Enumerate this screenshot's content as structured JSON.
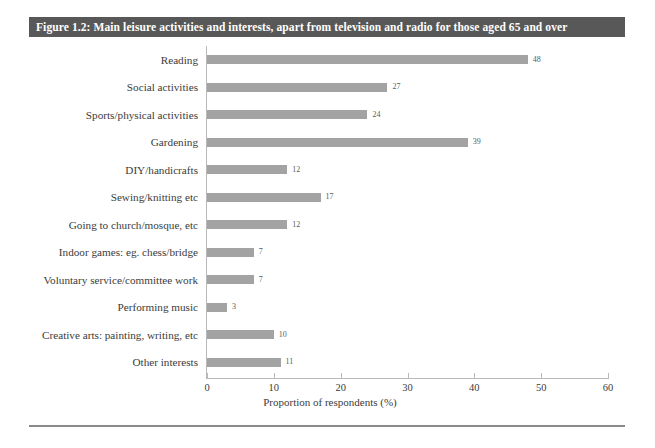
{
  "figure": {
    "title": "Figure 1.2: Main leisure activities and interests, apart from television and radio for those aged 65 and over",
    "title_bar_color": "#585858",
    "title_text_color": "#ffffff",
    "bar_color": "#a3a3a3",
    "axis_color": "#b9b9b9",
    "text_color": "#3b3b3b"
  },
  "chart_data": {
    "type": "bar",
    "orientation": "horizontal",
    "title": "Figure 1.2: Main leisure activities and interests, apart from television and radio for those aged 65 and over",
    "xlabel": "Proportion of respondents (%)",
    "ylabel": "",
    "xlim": [
      0,
      60
    ],
    "xticks": [
      0,
      10,
      20,
      30,
      40,
      50,
      60
    ],
    "xtick_labels": [
      "0",
      "10",
      "20",
      "30",
      "40",
      "50",
      "60"
    ],
    "grid": false,
    "legend": null,
    "categories": [
      "Reading",
      "Social activities",
      "Sports/physical activities",
      "Gardening",
      "DIY/handicrafts",
      "Sewing/knitting etc",
      "Going to church/mosque, etc",
      "Indoor games: eg. chess/bridge",
      "Voluntary service/committee work",
      "Performing music",
      "Creative arts: painting, writing, etc",
      "Other interests"
    ],
    "values": [
      48,
      27,
      24,
      39,
      12,
      17,
      12,
      7,
      7,
      3,
      10,
      11
    ],
    "value_labels": [
      "48",
      "27",
      "24",
      "39",
      "12",
      "17",
      "12",
      "7",
      "7",
      "3",
      "10",
      "11"
    ]
  }
}
